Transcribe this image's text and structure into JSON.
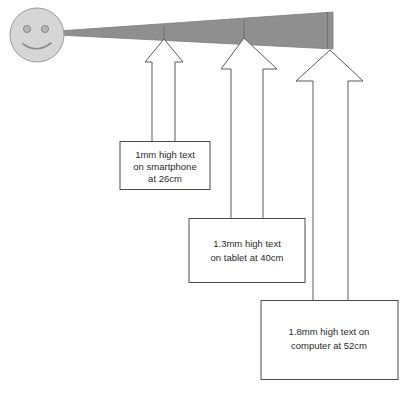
{
  "figure": {
    "background_color": "#ffffff"
  },
  "viewer": {
    "icon_name": "smiley-face-icon",
    "face_fill": "#d6d6d6",
    "face_stroke": "#9a9a9a",
    "eye_fill": "#b4b4b4",
    "center_x": 37,
    "center_y": 35,
    "radius": 27
  },
  "beam": {
    "label": "visual-cone",
    "fill_color": "#8f8f8f",
    "stroke_color": "#7d7d7d",
    "origin_x": 58,
    "origin_y": 33,
    "end_x": 333,
    "end_top_y": 12,
    "end_bottom_y": 49,
    "dividers": [
      {
        "x": 164,
        "top_y": 27,
        "bottom_y": 41
      },
      {
        "x": 244,
        "top_y": 20,
        "bottom_y": 45
      },
      {
        "x": 328,
        "top_y": 12,
        "bottom_y": 49
      }
    ]
  },
  "callouts": [
    {
      "id": "smartphone",
      "device": "smartphone",
      "text_height": "1mm",
      "distance": "26cm",
      "lines": [
        "1mm high text",
        "on smartphone",
        "at 26cm"
      ],
      "arrow_name": "arrow-smartphone",
      "box_name": "callout-box-smartphone"
    },
    {
      "id": "tablet",
      "device": "tablet",
      "text_height": "1.3mm",
      "distance": "40cm",
      "lines": [
        "1.3mm high text",
        "on tablet at 40cm"
      ],
      "arrow_name": "arrow-tablet",
      "box_name": "callout-box-tablet"
    },
    {
      "id": "computer",
      "device": "computer",
      "text_height": "1.8mm",
      "distance": "52cm",
      "lines": [
        "1.8mm high text on",
        "computer at 52cm"
      ],
      "arrow_name": "arrow-computer",
      "box_name": "callout-box-computer"
    }
  ]
}
